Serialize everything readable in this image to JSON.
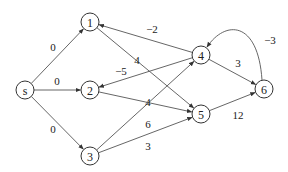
{
  "diagram": {
    "type": "directed-weighted-graph",
    "nodes": [
      {
        "id": "s",
        "label": "s"
      },
      {
        "id": "1",
        "label": "1"
      },
      {
        "id": "2",
        "label": "2"
      },
      {
        "id": "3",
        "label": "3"
      },
      {
        "id": "4",
        "label": "4"
      },
      {
        "id": "5",
        "label": "5"
      },
      {
        "id": "6",
        "label": "6"
      }
    ],
    "edges": [
      {
        "from": "s",
        "to": "1",
        "weight": "0"
      },
      {
        "from": "s",
        "to": "2",
        "weight": "0"
      },
      {
        "from": "s",
        "to": "3",
        "weight": "0"
      },
      {
        "from": "1",
        "to": "5",
        "weight": "4"
      },
      {
        "from": "4",
        "to": "1",
        "weight": "−2"
      },
      {
        "from": "4",
        "to": "2",
        "weight": "−5"
      },
      {
        "from": "2",
        "to": "5",
        "weight": "4"
      },
      {
        "from": "3",
        "to": "4",
        "weight": "6"
      },
      {
        "from": "3",
        "to": "5",
        "weight": "3"
      },
      {
        "from": "4",
        "to": "6",
        "weight": "3"
      },
      {
        "from": "6",
        "to": "4",
        "weight": "−3"
      },
      {
        "from": "5",
        "to": "6",
        "weight": "12"
      }
    ]
  }
}
